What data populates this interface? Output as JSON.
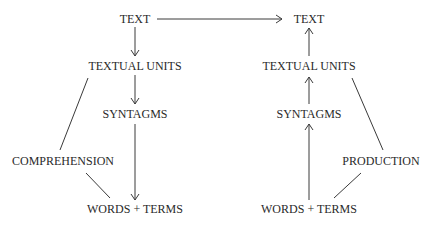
{
  "diagram": {
    "type": "flow",
    "left_column": {
      "label": "COMPREHENSION",
      "nodes": [
        {
          "id": "l_text",
          "label": "TEXT"
        },
        {
          "id": "l_units",
          "label": "TEXTUAL UNITS"
        },
        {
          "id": "l_syntagms",
          "label": "SYNTAGMS"
        },
        {
          "id": "l_words",
          "label": "WORDS + TERMS"
        }
      ]
    },
    "right_column": {
      "label": "PRODUCTION",
      "nodes": [
        {
          "id": "r_text",
          "label": "TEXT"
        },
        {
          "id": "r_units",
          "label": "TEXTUAL UNITS"
        },
        {
          "id": "r_syntagms",
          "label": "SYNTAGMS"
        },
        {
          "id": "r_words",
          "label": "WORDS + TERMS"
        }
      ]
    },
    "edges": [
      {
        "from": "l_text",
        "to": "r_text",
        "arrow": true
      },
      {
        "from": "l_text",
        "to": "l_units",
        "arrow": true
      },
      {
        "from": "l_units",
        "to": "l_syntagms",
        "arrow": true
      },
      {
        "from": "l_syntagms",
        "to": "l_words",
        "arrow": true
      },
      {
        "from": "l_units",
        "to": "comprehension",
        "arrow": false
      },
      {
        "from": "comprehension",
        "to": "l_words",
        "arrow": false
      },
      {
        "from": "r_words",
        "to": "r_syntagms",
        "arrow": true
      },
      {
        "from": "r_syntagms",
        "to": "r_units",
        "arrow": true
      },
      {
        "from": "r_units",
        "to": "r_text",
        "arrow": true
      },
      {
        "from": "r_units",
        "to": "production",
        "arrow": false
      },
      {
        "from": "production",
        "to": "r_words",
        "arrow": false
      }
    ],
    "colors": {
      "background": "#ffffff",
      "ink": "#2a2a2a"
    }
  }
}
